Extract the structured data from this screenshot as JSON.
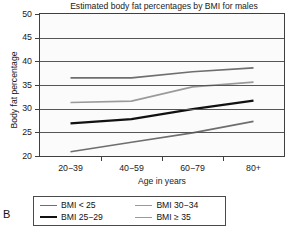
{
  "panel_label": "B",
  "chart_data": {
    "type": "line",
    "title": "Estimated body fat percentages by BMI for males",
    "xlabel": "Age in years",
    "ylabel": "Body fat percentage",
    "categories": [
      "20−39",
      "40−59",
      "60−79",
      "80+"
    ],
    "ylim": [
      20,
      50
    ],
    "yticks": [
      20,
      25,
      30,
      35,
      40,
      45,
      50
    ],
    "ytick_labels": [
      "20",
      "25",
      "30",
      "35",
      "40",
      "45",
      "50"
    ],
    "grid": true,
    "legend_position": "below-plot",
    "series": [
      {
        "name": "BMI < 25",
        "values": [
          36.5,
          36.5,
          37.8,
          38.6
        ],
        "color": "#6e6e6e",
        "width": 1.7
      },
      {
        "name": "BMI 25−29",
        "values": [
          26.9,
          27.8,
          29.9,
          31.7
        ],
        "color": "#111111",
        "width": 2.2
      },
      {
        "name": "BMI 30−34",
        "values": [
          31.3,
          31.6,
          34.6,
          35.6
        ],
        "color": "#9a9a9a",
        "width": 1.7
      },
      {
        "name": "BMI ≥ 35",
        "values": [
          20.9,
          22.9,
          24.9,
          27.3
        ],
        "color": "#6e6e6e",
        "width": 1.7
      }
    ],
    "legend_entries": [
      {
        "label": "BMI < 25",
        "color": "#6e6e6e",
        "width": 1.7
      },
      {
        "label": "BMI 30−34",
        "color": "#9a9a9a",
        "width": 1.7
      },
      {
        "label": "BMI 25−29",
        "color": "#111111",
        "width": 2.2
      },
      {
        "label": "BMI ≥ 35",
        "color": "#9a9a9a",
        "width": 1.7
      }
    ]
  }
}
